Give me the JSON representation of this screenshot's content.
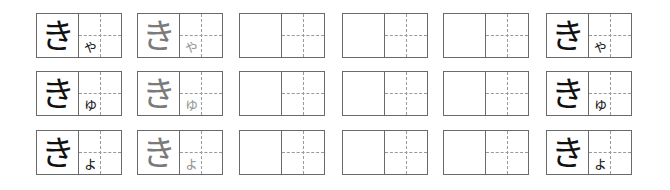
{
  "worksheet": {
    "title": "",
    "colors": {
      "border": "#6a6a6a",
      "guide_dashed": "#9a9a9a",
      "model_text": "#111111",
      "trace_text": "#7a7a7a"
    },
    "rows": [
      {
        "kana": "きゃ",
        "cells": [
          {
            "type": "model",
            "main": "き",
            "small": "ゃ"
          },
          {
            "type": "trace",
            "main": "き",
            "small": "ゃ"
          },
          {
            "type": "blank",
            "main": "",
            "small": ""
          },
          {
            "type": "blank",
            "main": "",
            "small": ""
          },
          {
            "type": "blank",
            "main": "",
            "small": ""
          },
          {
            "type": "model",
            "main": "き",
            "small": "ゃ"
          }
        ]
      },
      {
        "kana": "きゅ",
        "cells": [
          {
            "type": "model",
            "main": "き",
            "small": "ゅ"
          },
          {
            "type": "trace",
            "main": "き",
            "small": "ゅ"
          },
          {
            "type": "blank",
            "main": "",
            "small": ""
          },
          {
            "type": "blank",
            "main": "",
            "small": ""
          },
          {
            "type": "blank",
            "main": "",
            "small": ""
          },
          {
            "type": "model",
            "main": "き",
            "small": "ゅ"
          }
        ]
      },
      {
        "kana": "きょ",
        "cells": [
          {
            "type": "model",
            "main": "き",
            "small": "ょ"
          },
          {
            "type": "trace",
            "main": "き",
            "small": "ょ"
          },
          {
            "type": "blank",
            "main": "",
            "small": ""
          },
          {
            "type": "blank",
            "main": "",
            "small": ""
          },
          {
            "type": "blank",
            "main": "",
            "small": ""
          },
          {
            "type": "model",
            "main": "き",
            "small": "ょ"
          }
        ]
      }
    ]
  }
}
